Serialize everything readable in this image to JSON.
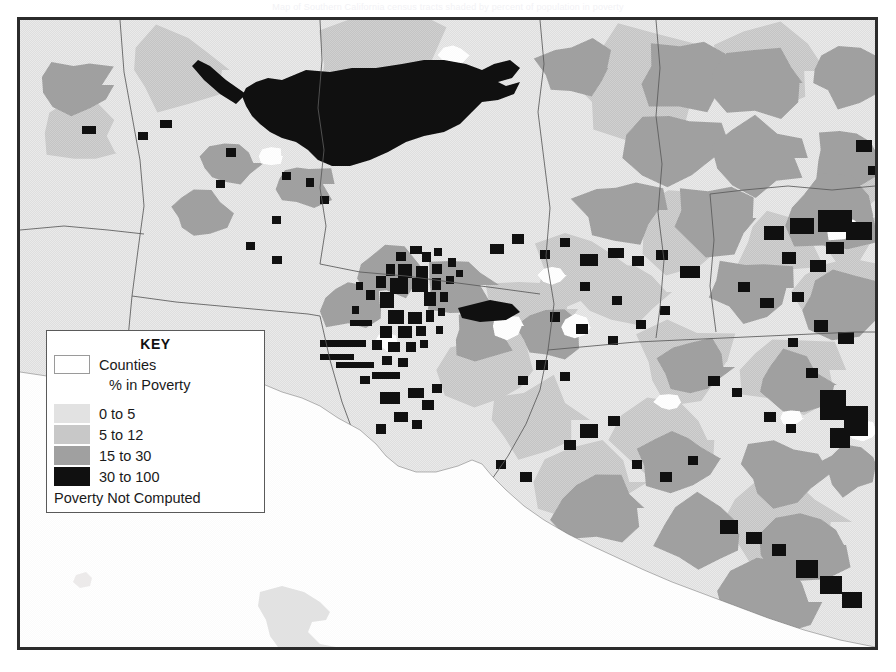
{
  "page": {
    "caption_top": "Map of Southern California census tracts shaded by percent of population in poverty"
  },
  "map": {
    "name": "poverty-choropleth-map",
    "region": "Southern California (Los Angeles / Orange / Riverside / San Bernardino / Ventura counties)",
    "border_color": "#2b2b2b",
    "ocean_color": "#ffffff"
  },
  "legend": {
    "title": "KEY",
    "counties_label": "Counties",
    "counties_swatch_color": "#ffffff",
    "subheading": "% in Poverty",
    "footer_label": "Poverty Not Computed",
    "classes": [
      {
        "label": "0 to 5",
        "color": "#e2e2e2",
        "low": 0,
        "high": 5
      },
      {
        "label": "5 to 12",
        "color": "#c8c8c8",
        "low": 5,
        "high": 12
      },
      {
        "label": "15 to 30",
        "color": "#a0a0a0",
        "low": 15,
        "high": 30
      },
      {
        "label": "30 to 100",
        "color": "#101010",
        "low": 30,
        "high": 100
      }
    ]
  },
  "chart_data": {
    "type": "heatmap",
    "title": "% in Poverty",
    "subtitle": "Counties",
    "xlabel": "",
    "ylabel": "",
    "legend_position": "lower-left",
    "grid": false,
    "categories": [
      "0 to 5",
      "5 to 12",
      "15 to 30",
      "30 to 100",
      "Poverty Not Computed"
    ],
    "colors": [
      "#e2e2e2",
      "#c8c8c8",
      "#a0a0a0",
      "#101010",
      "#ffffff"
    ],
    "value_ranges": [
      [
        0,
        5
      ],
      [
        5,
        12
      ],
      [
        15,
        30
      ],
      [
        30,
        100
      ],
      null
    ],
    "annotations": [
      "Large contiguous 30 to 100 percent class area across the northern mountain region",
      "Dense cluster of 30 to 100 percent tracts in the central urban core",
      "Scattered 30 to 100 percent tracts along the eastern portion of the map",
      "White unshaded ocean occupies the southwestern portion of the map",
      "Two offshore islands shaded in the 0 to 5 percent class"
    ]
  }
}
